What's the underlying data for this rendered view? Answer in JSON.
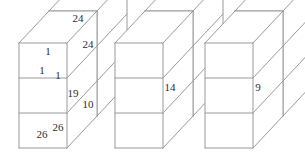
{
  "figure": {
    "background_color": "#ffffff",
    "line_color": "#9a9a9a",
    "text_color": "#2b2b2b",
    "canvas": {
      "width": 305,
      "height": 159
    },
    "projection": {
      "depth_dx": 30,
      "depth_dy": -32,
      "cell_width": 48,
      "cell_height": 35,
      "rows": 3,
      "columns": 1,
      "layers": 2
    }
  },
  "blocks": [
    {
      "name": "block-1",
      "origin_x": 19,
      "origin_y": 148,
      "labels": [
        {
          "name": "label-top-far",
          "text": "24",
          "x": 78,
          "y": 19
        },
        {
          "name": "label-side-top-far",
          "text": "24",
          "x": 88,
          "y": 45
        },
        {
          "name": "label-top-near",
          "text": "1",
          "y": 52,
          "x": 48
        },
        {
          "name": "label-front-top",
          "text": "1",
          "x": 42,
          "y": 71
        },
        {
          "name": "label-side-top-near",
          "text": "1",
          "x": 58,
          "y": 76
        },
        {
          "name": "label-side-middle",
          "text": "19",
          "x": 73,
          "y": 94
        },
        {
          "name": "label-side-mid-far",
          "text": "10",
          "x": 88,
          "y": 105
        },
        {
          "name": "label-front-bottom",
          "text": "26",
          "x": 42,
          "y": 135
        },
        {
          "name": "label-side-bottom",
          "text": "26",
          "x": 58,
          "y": 128
        }
      ]
    },
    {
      "name": "block-2",
      "origin_x": 115,
      "origin_y": 148,
      "labels": [
        {
          "name": "label-side-middle",
          "text": "14",
          "x": 170,
          "y": 88
        }
      ]
    },
    {
      "name": "block-3",
      "origin_x": 205,
      "origin_y": 148,
      "labels": [
        {
          "name": "label-side-middle",
          "text": "9",
          "x": 258,
          "y": 88
        }
      ]
    }
  ]
}
